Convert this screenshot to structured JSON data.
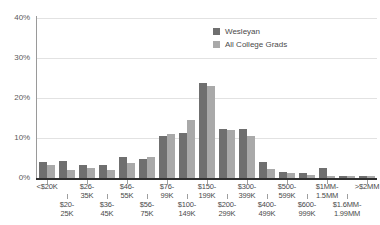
{
  "chart_data": {
    "type": "bar",
    "title": "",
    "subtitle": "",
    "xlabel": "",
    "ylabel": "",
    "ylim": [
      0,
      40
    ],
    "ytick_labels": [
      "0%",
      "10%",
      "20%",
      "30%",
      "40%"
    ],
    "ytick_values": [
      0,
      10,
      20,
      30,
      40
    ],
    "grid": true,
    "legend_position": "top-right",
    "categories": [
      "<$20K",
      "$20-25K",
      "$26-35K",
      "$36-45K",
      "$46-55K",
      "$56-75K",
      "$76-99K",
      "$100-149K",
      "$150-199K",
      "$200-299K",
      "$300-399K",
      "$400-499K",
      "$500-599K",
      "$600-999K",
      "$1MM-1.5MM",
      "$1.6MM-1.99MM",
      ">$2MM"
    ],
    "category_lines": [
      [
        "<$20K",
        ""
      ],
      [
        "$20-",
        "25K"
      ],
      [
        "$26-",
        "35K"
      ],
      [
        "$36-",
        "45K"
      ],
      [
        "$46-",
        "55K"
      ],
      [
        "$56-",
        "75K"
      ],
      [
        "$76-",
        "99K"
      ],
      [
        "$100-",
        "149K"
      ],
      [
        "$150-",
        "199K"
      ],
      [
        "$200-",
        "299K"
      ],
      [
        "$300-",
        "399K"
      ],
      [
        "$400-",
        "499K"
      ],
      [
        "$500-",
        "599K"
      ],
      [
        "$600-",
        "999K"
      ],
      [
        "$1MM-",
        "1.5MM"
      ],
      [
        "$1.6MM-",
        "1.99MM"
      ],
      [
        ">$2MM",
        ""
      ]
    ],
    "series": [
      {
        "name": "Wesleyan",
        "color": "#6f6f6f",
        "values": [
          4.0,
          4.3,
          3.3,
          3.2,
          5.2,
          4.7,
          10.6,
          11.3,
          23.8,
          12.3,
          12.2,
          4.0,
          1.5,
          1.3,
          2.5,
          0.5,
          0.6
        ]
      },
      {
        "name": "All College Grads",
        "color": "#a9a9a9",
        "values": [
          3.3,
          2.1,
          2.6,
          1.9,
          3.8,
          5.3,
          11.0,
          14.5,
          23.0,
          12.0,
          10.6,
          2.3,
          1.2,
          0.8,
          0.4,
          0.4,
          0.5
        ]
      }
    ]
  },
  "legend": {
    "items": [
      {
        "label": "Wesleyan",
        "color": "#6f6f6f"
      },
      {
        "label": "All College Grads",
        "color": "#a9a9a9"
      }
    ]
  }
}
